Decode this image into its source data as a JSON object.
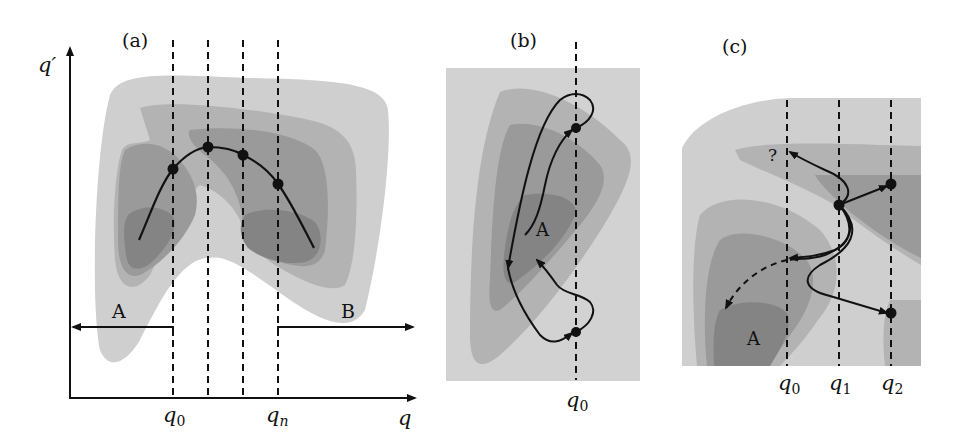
{
  "colors": {
    "level1": "#cfcfcf",
    "level2": "#b3b3b3",
    "level3": "#9a9a9a",
    "level4": "#848484",
    "background_b": "#d2d2d2",
    "ink": "#111111"
  },
  "panel_a": {
    "label": "(a)",
    "y_axis_label": "q′",
    "x_axis_label": "q",
    "tick_q0": "q",
    "tick_q0_sub": "0",
    "tick_qn": "q",
    "tick_qn_sub": "n",
    "basin_a": "A",
    "basin_b": "B"
  },
  "panel_b": {
    "label": "(b)",
    "basin_a": "A",
    "tick_q0": "q",
    "tick_q0_sub": "0"
  },
  "panel_c": {
    "label": "(c)",
    "basin_a": "A",
    "question": "?",
    "tick_q0": "q",
    "tick_q0_sub": "0",
    "tick_q1": "q",
    "tick_q1_sub": "1",
    "tick_q2": "q",
    "tick_q2_sub": "2"
  }
}
